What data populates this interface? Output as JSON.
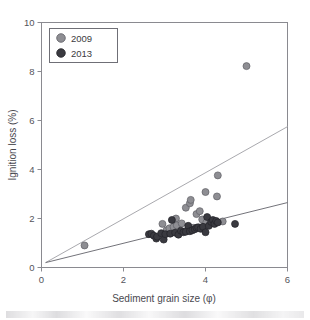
{
  "chart_data": {
    "type": "scatter",
    "title": "",
    "xlabel": "Sediment grain size (φ)",
    "ylabel": "Ignition loss (%)",
    "xlim": [
      0,
      6
    ],
    "ylim": [
      0,
      10
    ],
    "xticks": [
      0,
      2,
      4,
      6
    ],
    "yticks": [
      0,
      2,
      4,
      6,
      8,
      10
    ],
    "grid": false,
    "legend_position": "top-left",
    "series": [
      {
        "name": "2009",
        "color": "#8e8e93",
        "marker": "circle",
        "points": [
          [
            1.05,
            0.9
          ],
          [
            2.95,
            1.78
          ],
          [
            3.05,
            1.52
          ],
          [
            3.12,
            1.6
          ],
          [
            3.22,
            1.66
          ],
          [
            3.28,
            2.0
          ],
          [
            3.3,
            1.72
          ],
          [
            3.42,
            1.8
          ],
          [
            3.52,
            2.44
          ],
          [
            3.58,
            1.56
          ],
          [
            3.62,
            2.62
          ],
          [
            3.64,
            2.76
          ],
          [
            3.7,
            1.62
          ],
          [
            3.78,
            2.18
          ],
          [
            3.86,
            2.3
          ],
          [
            3.92,
            1.96
          ],
          [
            4.0,
            3.08
          ],
          [
            4.02,
            1.84
          ],
          [
            4.12,
            1.82
          ],
          [
            4.28,
            2.9
          ],
          [
            4.3,
            3.76
          ],
          [
            4.42,
            1.88
          ],
          [
            5.0,
            8.22
          ]
        ]
      },
      {
        "name": "2013",
        "color": "#3a3a40",
        "marker": "circle",
        "points": [
          [
            2.62,
            1.36
          ],
          [
            2.68,
            1.38
          ],
          [
            2.74,
            1.3
          ],
          [
            2.8,
            1.18
          ],
          [
            2.82,
            1.26
          ],
          [
            2.92,
            1.4
          ],
          [
            2.98,
            1.14
          ],
          [
            3.02,
            1.36
          ],
          [
            3.14,
            1.38
          ],
          [
            3.18,
            1.94
          ],
          [
            3.26,
            1.42
          ],
          [
            3.34,
            1.34
          ],
          [
            3.4,
            1.5
          ],
          [
            3.46,
            1.44
          ],
          [
            3.52,
            1.46
          ],
          [
            3.58,
            1.7
          ],
          [
            3.62,
            1.48
          ],
          [
            3.68,
            1.52
          ],
          [
            3.74,
            1.56
          ],
          [
            3.78,
            1.62
          ],
          [
            3.82,
            1.64
          ],
          [
            3.88,
            1.58
          ],
          [
            3.94,
            1.66
          ],
          [
            4.0,
            1.44
          ],
          [
            4.04,
            2.06
          ],
          [
            4.08,
            1.7
          ],
          [
            4.14,
            1.86
          ],
          [
            4.18,
            1.94
          ],
          [
            4.22,
            1.78
          ],
          [
            4.26,
            1.9
          ],
          [
            4.3,
            1.84
          ],
          [
            4.72,
            1.78
          ]
        ]
      }
    ],
    "trendlines": [
      {
        "name": "2009-trend",
        "color": "#a9a9ae",
        "x0": 0.1,
        "y0": 0.2,
        "x1": 6.0,
        "y1": 5.75
      },
      {
        "name": "2013-trend",
        "color": "#73737a",
        "x0": 0.1,
        "y0": 0.2,
        "x1": 6.0,
        "y1": 2.65
      }
    ]
  },
  "legend": {
    "entries": [
      {
        "label": "2009"
      },
      {
        "label": "2013"
      }
    ]
  },
  "axes": {
    "x": {
      "title": "Sediment grain size (φ)",
      "tick_labels": [
        "0",
        "2",
        "4",
        "6"
      ]
    },
    "y": {
      "title": "Ignition loss (%)",
      "tick_labels": [
        "0",
        "2",
        "4",
        "6",
        "8",
        "10"
      ]
    }
  },
  "colors": {
    "series_2009": "#8e8e93",
    "series_2013": "#3a3a40",
    "frame": "#8a8a90",
    "trend_2009": "#a9a9ae",
    "trend_2013": "#73737a"
  }
}
